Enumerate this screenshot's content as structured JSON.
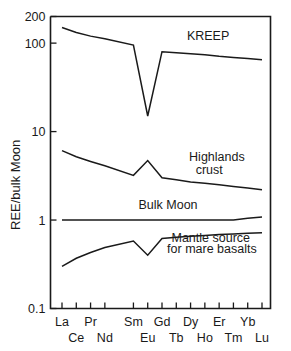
{
  "figure": {
    "y_axis_label": "REE/bulk Moon"
  },
  "chart_data": {
    "type": "line",
    "title": "",
    "xlabel": "",
    "ylabel": "REE/bulk Moon",
    "yscale": "log",
    "ylim": [
      0.1,
      200
    ],
    "ytick_labels": [
      "200",
      "100",
      "10",
      "1",
      "0.1"
    ],
    "ytick_values": [
      200,
      100,
      10,
      1,
      0.1
    ],
    "grid": false,
    "legend": "inline annotations",
    "categories": [
      "La",
      "Ce",
      "Pr",
      "Nd",
      "Sm",
      "Eu",
      "Gd",
      "Tb",
      "Dy",
      "Ho",
      "Er",
      "Tm",
      "Yb",
      "Lu"
    ],
    "xtick_labels_upper": [
      "La",
      "",
      "Pr",
      "",
      "Sm",
      "",
      "Gd",
      "",
      "Dy",
      "",
      "Er",
      "",
      "Yb",
      ""
    ],
    "xtick_labels_lower": [
      "",
      "Ce",
      "",
      "Nd",
      "",
      "Eu",
      "",
      "Tb",
      "",
      "Ho",
      "",
      "Tm",
      "",
      "Lu"
    ],
    "note": "Promethium (Pm) position is skipped between Nd and Sm leaving a gap in tick spacing",
    "series": [
      {
        "name": "KREEP",
        "label": "KREEP",
        "values": [
          150,
          132,
          120,
          112,
          95,
          15,
          80,
          78,
          76,
          74,
          71,
          69,
          67,
          65
        ]
      },
      {
        "name": "Highlands crust",
        "label": "Highlands crust",
        "label_lines": [
          "Highlands",
          "crust"
        ],
        "values": [
          6.1,
          5.2,
          4.6,
          4.1,
          3.2,
          4.7,
          3.0,
          2.85,
          2.7,
          2.6,
          2.5,
          2.4,
          2.3,
          2.2
        ]
      },
      {
        "name": "Bulk Moon",
        "label": "Bulk Moon",
        "values": [
          1.0,
          1.0,
          1.0,
          1.0,
          1.0,
          1.0,
          1.0,
          1.0,
          1.0,
          1.0,
          1.0,
          1.0,
          1.05,
          1.08
        ]
      },
      {
        "name": "Mantle source for mare basalts",
        "label": "Mantle source for mare basalts",
        "label_lines": [
          "Mantle source",
          "for mare basalts"
        ],
        "values": [
          0.3,
          0.37,
          0.43,
          0.49,
          0.58,
          0.4,
          0.62,
          0.64,
          0.655,
          0.67,
          0.685,
          0.695,
          0.71,
          0.72
        ]
      }
    ],
    "annotations": [
      {
        "text": "KREEP",
        "x": 0.62,
        "y": 110
      },
      {
        "text": "Highlands",
        "x": 0.63,
        "y": 4.6
      },
      {
        "text": "crust",
        "x": 0.66,
        "y": 3.3
      },
      {
        "text": "Bulk Moon",
        "x": 0.4,
        "y": 1.35
      },
      {
        "text": "Mantle source",
        "x": 0.55,
        "y": 0.56
      },
      {
        "text": "for mare basalts",
        "x": 0.53,
        "y": 0.43
      }
    ],
    "colors": {
      "line": "#1a1a1a",
      "axis": "#1a1a1a",
      "background": "#ffffff"
    }
  }
}
